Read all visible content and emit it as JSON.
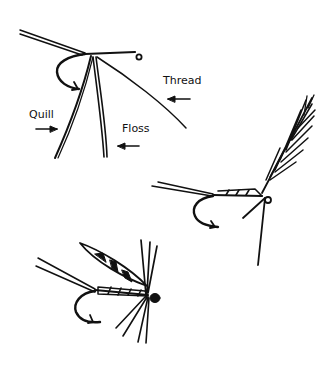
{
  "diagram": {
    "type": "fly-tying illustration",
    "stroke_color": "#111111",
    "background": "#ffffff",
    "figures": [
      {
        "name": "materials-tied-in",
        "labels": [
          {
            "text": "Thread",
            "x": 163,
            "y": 84
          },
          {
            "text": "Quill",
            "x": 29,
            "y": 118
          },
          {
            "text": "Floss",
            "x": 122,
            "y": 132
          }
        ]
      },
      {
        "name": "dry-fly-with-upright-wing",
        "labels": []
      },
      {
        "name": "wet-fly-with-mottled-wing",
        "labels": []
      }
    ]
  }
}
